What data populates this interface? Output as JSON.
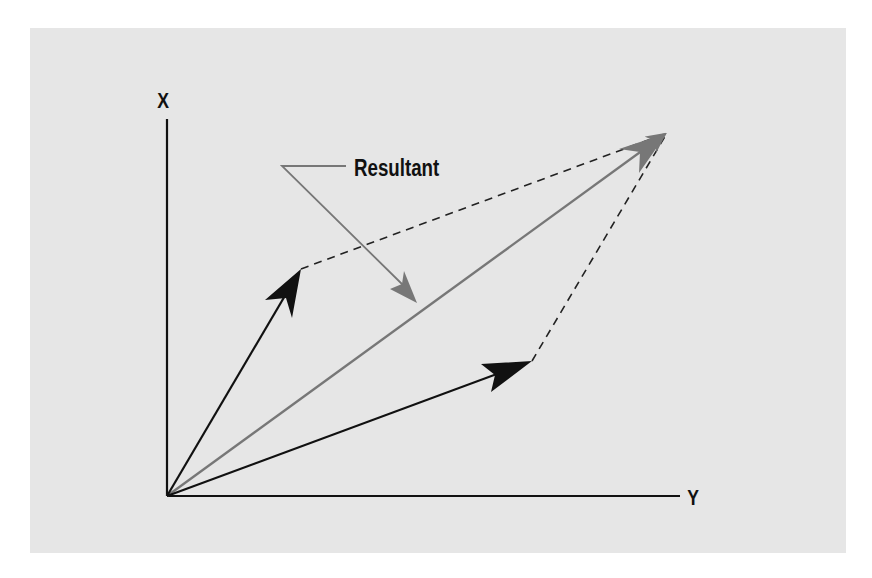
{
  "diagram": {
    "type": "vector-parallelogram",
    "colors": {
      "background": "#ffffff",
      "panel": "#e6e6e6",
      "axis": "#111111",
      "vector": "#111111",
      "resultant": "#777777",
      "dashed": "#222222",
      "callout": "#777777"
    },
    "axes": {
      "vertical_label": "X",
      "horizontal_label": "Y",
      "origin": [
        167,
        496
      ],
      "vertical_end": [
        167,
        119
      ],
      "horizontal_end": [
        680,
        496
      ]
    },
    "vectors": [
      {
        "name": "vector-a",
        "from": [
          167,
          496
        ],
        "to": [
          301,
          269
        ]
      },
      {
        "name": "vector-b",
        "from": [
          167,
          496
        ],
        "to": [
          532,
          361
        ]
      }
    ],
    "resultant": {
      "from": [
        167,
        496
      ],
      "to": [
        667,
        133
      ]
    },
    "parallelogram_dashed": [
      {
        "from": [
          301,
          269
        ],
        "to": [
          667,
          133
        ]
      },
      {
        "from": [
          532,
          361
        ],
        "to": [
          667,
          133
        ]
      }
    ],
    "callout": {
      "text": "Resultant",
      "leader_start": [
        346,
        166
      ],
      "leader_corner": [
        282,
        166
      ],
      "leader_end": [
        417,
        303
      ]
    }
  }
}
